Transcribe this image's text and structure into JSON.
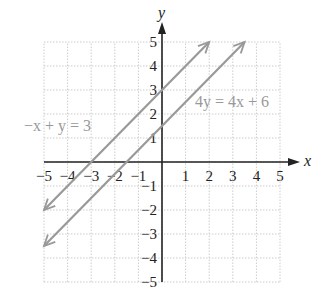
{
  "chart_data": {
    "type": "line",
    "title": "",
    "xlabel": "x",
    "ylabel": "y",
    "xlim": [
      -5,
      5
    ],
    "ylim": [
      -5,
      5
    ],
    "grid": true,
    "x_ticks": [
      "-5",
      "-4",
      "-3",
      "-2",
      "-1",
      "1",
      "2",
      "3",
      "4",
      "5"
    ],
    "y_ticks": [
      "5",
      "4",
      "3",
      "2",
      "1",
      "-1",
      "-2",
      "-3",
      "-4",
      "-5"
    ],
    "series": [
      {
        "name": "-x + y = 3",
        "equation": "y = x + 3",
        "x": [
          -5,
          2
        ],
        "y": [
          -2,
          5
        ],
        "arrows": "both"
      },
      {
        "name": "4y = 4x + 6",
        "equation": "y = x + 1.5",
        "x": [
          -5,
          3.5
        ],
        "y": [
          -3.5,
          5
        ],
        "arrows": "both"
      }
    ],
    "annotations": [
      {
        "text": "-x + y = 3",
        "x": -5.0,
        "y": 1.3
      },
      {
        "text": "4y = 4x + 6",
        "x": 1.7,
        "y": 2.4
      }
    ]
  },
  "labels": {
    "x_axis": "x",
    "y_axis": "y",
    "eq1": "−x + y = 3",
    "eq2": "4y = 4x + 6",
    "xt": [
      "−5",
      "−4",
      "−3",
      "−2",
      "−1",
      "1",
      "2",
      "3",
      "4",
      "5"
    ],
    "yt": [
      "5",
      "4",
      "3",
      "2",
      "1",
      "−1",
      "−2",
      "−3",
      "−4",
      "−5"
    ]
  },
  "colors": {
    "line": "#999999",
    "axis": "#222222",
    "grid": "#cccccc"
  }
}
